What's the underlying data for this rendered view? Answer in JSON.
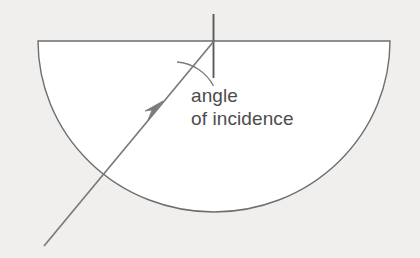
{
  "figure": {
    "background_color": "#f0efee",
    "medium_fill": "#ffffff",
    "outline_color": "#6e6e6e",
    "ray_color": "#7a7a7a",
    "normal_color": "#5a5a5a",
    "text_color": "#4c4c4c"
  },
  "labels": {
    "line1": "angle",
    "line2": "of incidence"
  },
  "geometry": {
    "canvas": {
      "width": 420,
      "height": 258
    },
    "semicircle": {
      "shape": "semicircle",
      "center_x": 214,
      "flat_top_y": 41,
      "radius": 176,
      "left_x": 38,
      "right_x": 390,
      "bottom_y": 212
    },
    "normal": {
      "x": 213,
      "y_top": 14,
      "y_bottom": 78,
      "description": "normal-line perpendicular to flat surface"
    },
    "incident_ray": {
      "start_x": 44,
      "start_y": 246,
      "end_x": 214,
      "end_y": 41,
      "arrow_x": 155,
      "arrow_y": 110,
      "crosses_arc_x": 103,
      "crosses_arc_y": 175
    },
    "angle_arc": {
      "vertex_x": 214,
      "vertex_y": 41,
      "radius": 45,
      "from_label": "normal",
      "to_label": "incident ray"
    }
  }
}
